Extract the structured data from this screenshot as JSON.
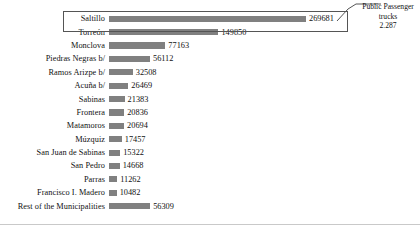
{
  "chart_data": {
    "type": "bar",
    "orientation": "horizontal",
    "title": "",
    "subtitle": "",
    "xlabel": "",
    "ylabel": "",
    "grid": false,
    "legend": "none",
    "xlim": [
      0,
      269681
    ],
    "categories": [
      "Saltillo",
      "Torreón",
      "Monclova",
      "Piedras Negras b/",
      "Ramos Arizpe b/",
      "Acuña b/",
      "Sabinas",
      "Frontera",
      "Matamoros",
      "Múzquiz",
      "San Juan de Sabinas",
      "San Pedro",
      "Parras",
      "Francisco I. Madero",
      "Rest of the Municipalities"
    ],
    "values": [
      269681,
      149850,
      77163,
      56112,
      32508,
      26469,
      21383,
      20836,
      20694,
      17457,
      15322,
      14668,
      11262,
      10482,
      56309
    ],
    "value_labels": [
      "269681",
      "149850",
      "77163",
      "56112",
      "32508",
      "26469",
      "21383",
      "20836",
      "20694",
      "17457",
      "15322",
      "14668",
      "11262",
      "10482",
      "56309"
    ],
    "bar_color": "#808080",
    "annotations": [
      {
        "target_category": "Saltillo",
        "line1": "Public Passenger",
        "line2": "trucks",
        "line3": "2.287"
      }
    ]
  },
  "annotation": {
    "line1": "Public Passenger",
    "line2": "trucks",
    "line3": "2.287"
  },
  "colors": {
    "bar": "#808080",
    "box_outline": "#555555",
    "text": "#111111",
    "axis": "#c9c9c9"
  }
}
